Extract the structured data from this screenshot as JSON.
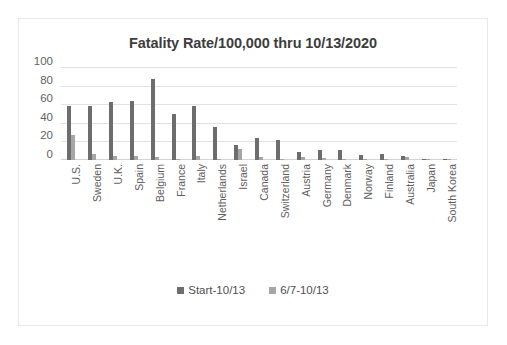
{
  "chart_data": {
    "type": "bar",
    "title": "Fatality Rate/100,000 thru 10/13/2020",
    "xlabel": "",
    "ylabel": "",
    "ylim": [
      0,
      100
    ],
    "yticks": [
      100,
      80,
      60,
      40,
      20,
      0
    ],
    "grid": true,
    "legend_position": "bottom",
    "categories": [
      "U.S.",
      "Sweden",
      "U.K.",
      "Spain",
      "Belgium",
      "France",
      "Italy",
      "Netherlands",
      "Israel",
      "Canada",
      "Switzerland",
      "Austria",
      "Germany",
      "Denmark",
      "Norway",
      "Finland",
      "Australia",
      "Japan",
      "South Korea"
    ],
    "series": [
      {
        "name": "Start-10/13",
        "color": "#6d6d6d",
        "values": [
          58,
          58,
          62,
          63,
          87,
          49,
          58,
          36,
          16,
          24,
          22,
          9,
          11,
          11,
          5,
          6,
          4,
          1.3,
          0.8
        ]
      },
      {
        "name": "6/7-10/13",
        "color": "#a6a6a6",
        "values": [
          27,
          7,
          4,
          4,
          3,
          1,
          4,
          1,
          12,
          3,
          1,
          3,
          2,
          1,
          0.6,
          0.8,
          3,
          0.8,
          0.4
        ]
      }
    ]
  },
  "legend": {
    "entries": [
      {
        "label": "Start-10/13",
        "color": "#6d6d6d"
      },
      {
        "label": "6/7-10/13",
        "color": "#a6a6a6"
      }
    ]
  },
  "colors": {
    "series_dark": "#6d6d6d",
    "series_light": "#a6a6a6",
    "gridline": "#e2e2e2",
    "border": "#e9e9e9",
    "background": "#ffffff",
    "title_text": "#3d3d3d",
    "tick_text": "#636363"
  }
}
